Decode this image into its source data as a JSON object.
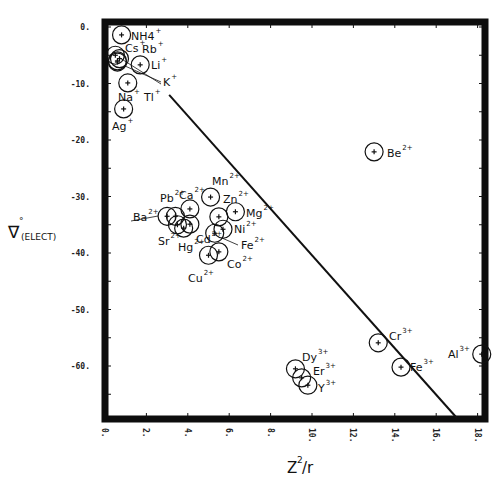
{
  "chart_data": {
    "type": "scatter",
    "title": "",
    "xlabel": "Z²/r",
    "ylabel": "∇°(ELECT)",
    "xlim": [
      0,
      18
    ],
    "ylim": [
      -70,
      0
    ],
    "grid": false,
    "x_ticks": [
      "0.",
      "2.",
      "4.",
      "6.",
      "8.",
      "10.",
      "12.",
      "14.",
      "16.",
      "18."
    ],
    "x_tick_values": [
      0,
      2,
      4,
      6,
      8,
      10,
      12,
      14,
      16,
      18
    ],
    "y_ticks": [
      "0.",
      "-10.",
      "-20.",
      "-30.",
      "-40.",
      "-50.",
      "-60."
    ],
    "y_tick_values": [
      0,
      -10,
      -20,
      -30,
      -40,
      -50,
      -60
    ],
    "points": [
      {
        "label": "NH4",
        "charge": "+",
        "x": 0.8,
        "y": -1.4
      },
      {
        "label": "Cs",
        "charge": "+",
        "x": 0.5,
        "y": -5.0
      },
      {
        "label": "Rb",
        "charge": "+",
        "x": 0.6,
        "y": -6.2
      },
      {
        "label": "Li",
        "charge": "+",
        "x": 1.7,
        "y": -6.7
      },
      {
        "label": "K",
        "charge": "+",
        "x": 0.6,
        "y": -6.0
      },
      {
        "label": "Tl",
        "charge": "+",
        "x": 0.7,
        "y": -5.6
      },
      {
        "label": "Na",
        "charge": "+",
        "x": 1.1,
        "y": -9.9
      },
      {
        "label": "Ag",
        "charge": "+",
        "x": 0.9,
        "y": -14.5
      },
      {
        "label": "Be",
        "charge": "2+",
        "x": 13.0,
        "y": -22.1
      },
      {
        "label": "Ba",
        "charge": "2+",
        "x": 3.0,
        "y": -33.5
      },
      {
        "label": "Pb",
        "charge": "2+",
        "x": 3.4,
        "y": -33.5
      },
      {
        "label": "Ca",
        "charge": "2+",
        "x": 4.1,
        "y": -32.2
      },
      {
        "label": "Mn",
        "charge": "2+",
        "x": 5.1,
        "y": -30.1
      },
      {
        "label": "Zn",
        "charge": "2+",
        "x": 5.5,
        "y": -33.6
      },
      {
        "label": "Mg",
        "charge": "2+",
        "x": 6.3,
        "y": -32.7
      },
      {
        "label": "Sr",
        "charge": "2+",
        "x": 3.5,
        "y": -35.0
      },
      {
        "label": "Hg",
        "charge": "2+",
        "x": 3.8,
        "y": -35.6
      },
      {
        "label": "Cd",
        "charge": "2+",
        "x": 4.1,
        "y": -34.9
      },
      {
        "label": "Ni",
        "charge": "2+",
        "x": 5.7,
        "y": -35.8
      },
      {
        "label": "Fe",
        "charge": "2+",
        "x": 5.3,
        "y": -36.5
      },
      {
        "label": "Cu",
        "charge": "2+",
        "x": 5.0,
        "y": -40.4
      },
      {
        "label": "Co",
        "charge": "2+",
        "x": 5.5,
        "y": -39.8
      },
      {
        "label": "Cr",
        "charge": "3+",
        "x": 13.2,
        "y": -55.9
      },
      {
        "label": "Fe",
        "charge": "3+",
        "x": 14.3,
        "y": -60.2
      },
      {
        "label": "Al",
        "charge": "3+",
        "x": 18.2,
        "y": -57.9
      },
      {
        "label": "Dy",
        "charge": "3+",
        "x": 9.2,
        "y": -60.5
      },
      {
        "label": "Er",
        "charge": "3+",
        "x": 9.5,
        "y": -62.1
      },
      {
        "label": "Y",
        "charge": "3+",
        "x": 9.8,
        "y": -63.4
      }
    ],
    "fit_line": {
      "x": [
        3.1,
        17.0
      ],
      "y": [
        -12.0,
        -69.2
      ]
    },
    "labels_display": [
      {
        "text": "NH4",
        "sup": "+",
        "x": 131,
        "y": 40
      },
      {
        "text": "Cs",
        "sup": "+",
        "x": 125,
        "y": 52
      },
      {
        "text": "Rb",
        "sup": "+",
        "x": 142,
        "y": 53
      },
      {
        "text": "Li",
        "sup": "+",
        "x": 151,
        "y": 69
      },
      {
        "text": "K",
        "sup": "+",
        "x": 163,
        "y": 86
      },
      {
        "text": "Na",
        "sup": "+",
        "x": 118,
        "y": 101
      },
      {
        "text": "Tl",
        "sup": "+",
        "x": 144,
        "y": 101
      },
      {
        "text": "Ag",
        "sup": "+",
        "x": 112,
        "y": 130
      },
      {
        "text": "Be",
        "sup": "2+",
        "x": 387,
        "y": 157
      },
      {
        "text": "Mn",
        "sup": "2+",
        "x": 212,
        "y": 185
      },
      {
        "text": "Pb",
        "sup": "2+",
        "x": 160,
        "y": 202
      },
      {
        "text": "Ca",
        "sup": "2+",
        "x": 179,
        "y": 199
      },
      {
        "text": "Zn",
        "sup": "2+",
        "x": 223,
        "y": 203
      },
      {
        "text": "Mg",
        "sup": "2+",
        "x": 246,
        "y": 217
      },
      {
        "text": "Ba",
        "sup": "2+",
        "x": 133,
        "y": 221
      },
      {
        "text": "Ni",
        "sup": "2+",
        "x": 234,
        "y": 233
      },
      {
        "text": "Sr",
        "sup": "2+",
        "x": 158,
        "y": 245
      },
      {
        "text": "Hg",
        "sup": "2+",
        "x": 178,
        "y": 251
      },
      {
        "text": "Cd",
        "sup": "2+",
        "x": 196,
        "y": 243
      },
      {
        "text": "Fe",
        "sup": "2+",
        "x": 241,
        "y": 249
      },
      {
        "text": "Co",
        "sup": "2+",
        "x": 227,
        "y": 268
      },
      {
        "text": "Cu",
        "sup": "2+",
        "x": 188,
        "y": 282
      },
      {
        "text": "Cr",
        "sup": "3+",
        "x": 389,
        "y": 340
      },
      {
        "text": "Fe",
        "sup": "3+",
        "x": 410,
        "y": 371
      },
      {
        "text": "Al",
        "sup": "3+",
        "x": 448,
        "y": 358
      },
      {
        "text": "Dy",
        "sup": "3+",
        "x": 302,
        "y": 361
      },
      {
        "text": "Er",
        "sup": "3+",
        "x": 313,
        "y": 375
      },
      {
        "text": "Y",
        "sup": "3+",
        "x": 318,
        "y": 392
      }
    ]
  },
  "axis": {
    "x_title_main": "Z",
    "x_title_sup": "2",
    "x_title_tail": "/r",
    "y_title_main": "∇",
    "y_title_sup": "°",
    "y_title_sub": "(ELECT)"
  }
}
